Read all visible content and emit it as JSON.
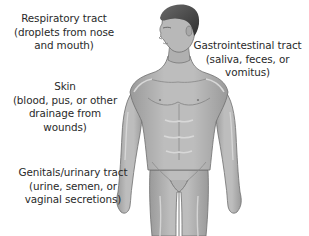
{
  "diagram": {
    "colors": {
      "background": "#ffffff",
      "text": "#2a2a2a",
      "skin": "#b8b8b8",
      "skin_shadow": "#8e8e8e",
      "skin_highlight": "#d8d8d8",
      "hair": "#4a4a4a",
      "outline": "#6e6e6e"
    },
    "labels": [
      {
        "id": "respiratory",
        "title": "Respiratory tract",
        "lines": [
          "Respiratory tract",
          "(droplets from nose",
          "and mouth)"
        ]
      },
      {
        "id": "gastrointestinal",
        "title": "Gastrointestinal tract",
        "lines": [
          "Gastrointestinal tract",
          "(saliva, feces, or",
          "vomitus)"
        ]
      },
      {
        "id": "skin",
        "title": "Skin",
        "lines": [
          "Skin",
          "(blood, pus, or other",
          "drainage from",
          "wounds)"
        ]
      },
      {
        "id": "genitourinary",
        "title": "Genitals/urinary tract",
        "lines": [
          "Genitals/urinary tract",
          "(urine, semen, or",
          "vaginal secretions)"
        ]
      }
    ]
  }
}
